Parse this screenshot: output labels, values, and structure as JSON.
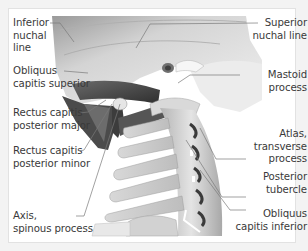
{
  "figure": {
    "colors": {
      "background": "#f3f3f3",
      "panel": "#ffffff",
      "bone_light": "#e8e8e8",
      "bone_mid": "#c8c8c8",
      "bone_dark": "#8e8e8e",
      "muscle": "#5a5a5a",
      "muscle_dark": "#333333",
      "leader_line": "#7a7a7a",
      "text": "#3a3a3a"
    },
    "labels_left": [
      {
        "id": "inferior-nuchal-line",
        "lines": [
          "Inferior",
          "nuchal",
          "line"
        ]
      },
      {
        "id": "obliquus-capitis-superior",
        "lines": [
          "Obliquus",
          "capitis superior"
        ]
      },
      {
        "id": "rectus-capitis-posterior-major",
        "lines": [
          "Rectus capitis",
          "posterior major"
        ]
      },
      {
        "id": "rectus-capitis-posterior-minor",
        "lines": [
          "Rectus capitis",
          "posterior minor"
        ]
      },
      {
        "id": "axis-spinous-process",
        "lines": [
          "Axis,",
          "spinous process"
        ]
      }
    ],
    "labels_right": [
      {
        "id": "superior-nuchal-line",
        "lines": [
          "Superior",
          "nuchal line"
        ]
      },
      {
        "id": "mastoid-process",
        "lines": [
          "Mastoid",
          "process"
        ]
      },
      {
        "id": "atlas-transverse-process",
        "lines": [
          "Atlas,",
          "transverse",
          "process"
        ]
      },
      {
        "id": "posterior-tubercle",
        "lines": [
          "Posterior",
          "tubercle"
        ]
      },
      {
        "id": "obliquus-capitis-inferior",
        "lines": [
          "Obliquus",
          "capitis inferior"
        ]
      }
    ]
  }
}
